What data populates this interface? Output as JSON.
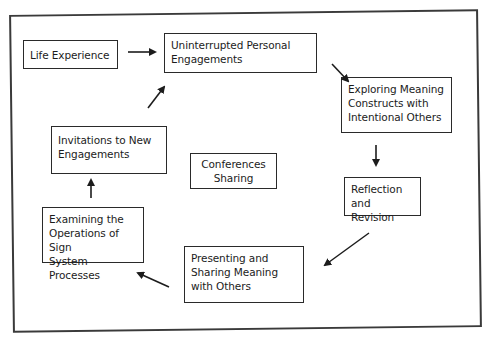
{
  "diagram": {
    "type": "cycle-flow",
    "nodes": [
      {
        "id": "life",
        "label": "Life Experience"
      },
      {
        "id": "uninterrupted",
        "label": "Uninterrupted Personal\nEngagements"
      },
      {
        "id": "exploring",
        "label": "Exploring Meaning\nConstructs with\nIntentional Others"
      },
      {
        "id": "reflection",
        "label": "Reflection\nand Revision"
      },
      {
        "id": "presenting",
        "label": "Presenting and\nSharing Meaning\nwith Others"
      },
      {
        "id": "examining",
        "label": "Examining the\nOperations of Sign\nSystem Processes"
      },
      {
        "id": "invitations",
        "label": "Invitations to New\nEngagements"
      },
      {
        "id": "conferences",
        "label": "Conferences\nSharing"
      }
    ],
    "edges": [
      {
        "from": "life",
        "to": "uninterrupted"
      },
      {
        "from": "uninterrupted",
        "to": "exploring"
      },
      {
        "from": "exploring",
        "to": "reflection"
      },
      {
        "from": "reflection",
        "to": "presenting"
      },
      {
        "from": "presenting",
        "to": "examining"
      },
      {
        "from": "examining",
        "to": "invitations"
      },
      {
        "from": "invitations",
        "to": "uninterrupted"
      }
    ],
    "colors": {
      "line": "#1c1c1c",
      "background": "#ffffff"
    }
  }
}
